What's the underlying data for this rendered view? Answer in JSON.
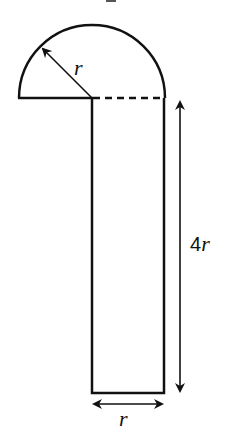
{
  "diagram": {
    "type": "composite-shape",
    "stroke_color": "#111111",
    "background": "#ffffff",
    "labels": {
      "radius": "r",
      "height": "4",
      "height_var": "r",
      "width": "r"
    },
    "dimensions": {
      "radius": "r",
      "rectangle_width": "r",
      "rectangle_height": "4r"
    },
    "components": [
      {
        "name": "semicircle",
        "center": "top-left corner of rectangle",
        "radius": "r"
      },
      {
        "name": "rectangle",
        "width": "r",
        "height": "4r"
      },
      {
        "name": "dashed-line",
        "note": "top edge of rectangle shown dashed"
      }
    ]
  }
}
